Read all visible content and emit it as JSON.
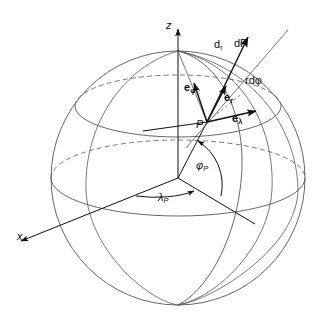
{
  "figure": {
    "background": "#ffffff",
    "stroke_color": "#4a4a4a",
    "dark_stroke_color": "#101010",
    "width": 323,
    "height": 321
  },
  "axes": [
    {
      "id": "z",
      "label": "z",
      "label_x": 166,
      "label_y": 20,
      "direction": "up"
    },
    {
      "id": "x",
      "label": "x",
      "label_x": 17,
      "label_y": 231,
      "direction": "down-left"
    }
  ],
  "point": {
    "id": "P",
    "label": "P",
    "label_x": 196,
    "label_y": 119,
    "x": 207,
    "y": 122
  },
  "unit_vectors": [
    {
      "id": "e_phi",
      "symbol": "e",
      "sub": "φ",
      "label_x": 186,
      "label_y": 85,
      "tip_x": 192,
      "tip_y": 89
    },
    {
      "id": "e_r",
      "symbol": "e",
      "sub": "r",
      "label_x": 226,
      "label_y": 95,
      "tip_x": 224,
      "tip_y": 92
    },
    {
      "id": "e_lambda",
      "symbol": "e",
      "sub": "λ",
      "label_x": 233,
      "label_y": 117,
      "tip_x": 251,
      "tip_y": 112
    }
  ],
  "differentials": [
    {
      "id": "dr",
      "text_main": "d",
      "text_sub": "r",
      "label_x": 216,
      "label_y": 43,
      "type": "radial"
    },
    {
      "id": "dP",
      "text_main": "dP",
      "text_sub": "",
      "label_x": 235,
      "label_y": 42,
      "type": "total"
    },
    {
      "id": "rdphi",
      "text_main": "rdφ",
      "text_sub": "",
      "label_x": 246,
      "label_y": 79,
      "type": "meridional"
    }
  ],
  "angles": [
    {
      "id": "phi_P",
      "symbol": "φ",
      "sub": "P",
      "label_x": 197,
      "label_y": 164,
      "name": "latitude"
    },
    {
      "id": "lambda_P",
      "symbol": "λ",
      "sub": "P",
      "label_x": 160,
      "label_y": 196,
      "name": "longitude"
    }
  ],
  "sphere": {
    "center_x": 178,
    "center_y": 178,
    "radius": 127,
    "equator_label": "equator",
    "parallel_label": "parallel of latitude"
  },
  "curves": {
    "equator_front_solid": true,
    "equator_back_dashed": true,
    "parallel_front_solid": true,
    "parallel_back_dashed": true,
    "meridian_count": 3
  }
}
